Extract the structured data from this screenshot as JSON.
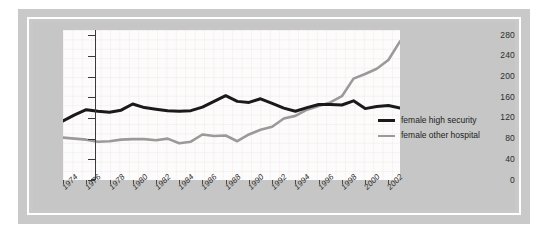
{
  "chart_data": {
    "type": "line",
    "title": "",
    "xlabel": "",
    "ylabel": "",
    "xlim": [
      1974,
      2003
    ],
    "ylim": [
      0,
      290
    ],
    "grid": true,
    "grid_style": "faint pink graph-paper grid",
    "legend_position": "middle-right inside plot",
    "y_ticks": [
      0,
      40,
      80,
      120,
      160,
      200,
      240,
      280
    ],
    "x_ticks": [
      1974,
      1976,
      1978,
      1980,
      1982,
      1984,
      1986,
      1988,
      1990,
      1992,
      1994,
      1996,
      1998,
      2000,
      2002
    ],
    "x_tick_labels": [
      "1974",
      "1976",
      "1978",
      "1980",
      "1982",
      "1984",
      "1986",
      "1988",
      "1990",
      "1992",
      "1994",
      "1996",
      "1998",
      "2000",
      "2002"
    ],
    "x": [
      1974,
      1975,
      1976,
      1977,
      1978,
      1979,
      1980,
      1981,
      1982,
      1983,
      1984,
      1985,
      1986,
      1987,
      1988,
      1989,
      1990,
      1991,
      1992,
      1993,
      1994,
      1995,
      1996,
      1997,
      1998,
      1999,
      2000,
      2001,
      2002,
      2003
    ],
    "series": [
      {
        "name": "female high security",
        "color": "#1a1a1a",
        "values": [
          114,
          126,
          136,
          133,
          131,
          135,
          147,
          140,
          137,
          134,
          133,
          134,
          141,
          152,
          163,
          152,
          150,
          157,
          148,
          139,
          133,
          140,
          146,
          146,
          145,
          153,
          138,
          142,
          144,
          139
        ]
      },
      {
        "name": "female other hospital",
        "color": "#9a9a9a",
        "values": [
          82,
          80,
          78,
          74,
          75,
          78,
          79,
          79,
          77,
          80,
          71,
          74,
          88,
          85,
          86,
          75,
          88,
          97,
          103,
          119,
          124,
          136,
          143,
          150,
          162,
          196,
          205,
          215,
          232,
          268
        ]
      }
    ]
  },
  "legend": {
    "entries": [
      {
        "label": "female high security",
        "color": "#1a1a1a"
      },
      {
        "label": "female other hospital",
        "color": "#9a9a9a"
      }
    ]
  },
  "colors": {
    "page_background": "#ffffff",
    "mat": "#c9c9c9",
    "inner_mat": "#c6c6c6",
    "plot_background": "#fbfbfb",
    "axis": "#3a3a3a",
    "grid": "#f0dede",
    "series_high_security": "#1a1a1a",
    "series_other_hospital": "#9a9a9a"
  }
}
